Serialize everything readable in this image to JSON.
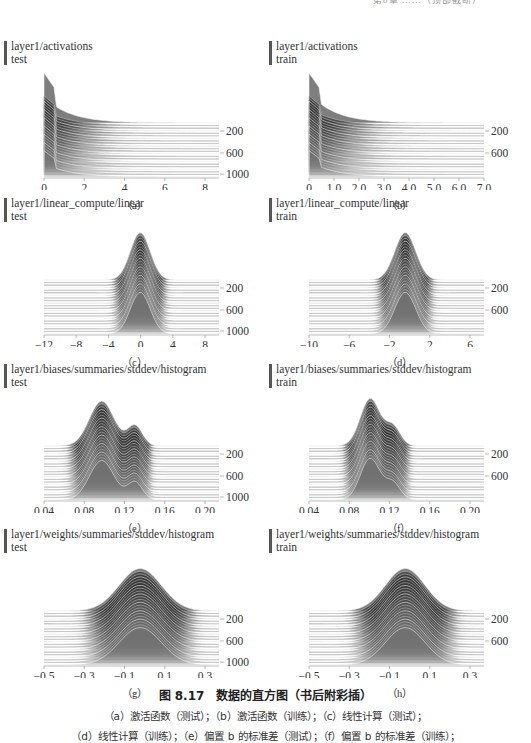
{
  "page": {
    "running_head": "第8章 ……（顶部截断）",
    "figure": {
      "number_title": "图 8.17　数据的直方图（书后附彩插）",
      "description_lines": [
        "（a）激活函数（测试）；（b）激活函数（训练）；（c）线性计算（测试）；",
        "（d）线性计算（训练）；（e）偏置 b 的标准差（测试）；（f）偏置 b 的标准差（训练）；"
      ]
    },
    "panels": [
      {
        "id": "a",
        "label": "（a）",
        "title": "layer1/activations",
        "subtitle": "test"
      },
      {
        "id": "b",
        "label": "（b）",
        "title": "layer1/activations",
        "subtitle": "train"
      },
      {
        "id": "c",
        "label": "（c）",
        "title": "layer1/linear_compute/linear",
        "subtitle": "test"
      },
      {
        "id": "d",
        "label": "（d）",
        "title": "layer1/linear_compute/linear",
        "subtitle": "train"
      },
      {
        "id": "e",
        "label": "（e）",
        "title": "layer1/biases/summaries/stddev/histogram",
        "subtitle": "test"
      },
      {
        "id": "f",
        "label": "（f）",
        "title": "layer1/biases/summaries/stddev/histogram",
        "subtitle": "train"
      },
      {
        "id": "g",
        "label": "（g）",
        "title": "layer1/weights/summaries/stddev/histogram",
        "subtitle": "test"
      },
      {
        "id": "h",
        "label": "（h）",
        "title": "layer1/weights/summaries/stddev/histogram",
        "subtitle": "train"
      }
    ]
  },
  "chart_data": [
    {
      "type": "area",
      "title": "layer1/activations",
      "subtitle": "test",
      "style": "tensorboard-histogram-offset",
      "x_ticks": [
        "0",
        "2",
        "4",
        "6",
        "8"
      ],
      "xlim": [
        0,
        9
      ],
      "y_ticks": [
        "200",
        "600",
        "1000"
      ],
      "ylabel": "step",
      "shape": "exponential decay with spike near 0"
    },
    {
      "type": "area",
      "title": "layer1/activations",
      "subtitle": "train",
      "style": "tensorboard-histogram-offset",
      "x_ticks": [
        "0",
        "1.0",
        "2.0",
        "3.0",
        "4.0",
        "5.0",
        "6.0",
        "7.0"
      ],
      "xlim": [
        0,
        7
      ],
      "y_ticks": [
        "200",
        "600"
      ],
      "ylabel": "step",
      "shape": "exponential decay with spike near 0"
    },
    {
      "type": "area",
      "title": "layer1/linear_compute/linear",
      "subtitle": "test",
      "style": "tensorboard-histogram-offset",
      "x_ticks": [
        "-12",
        "-8",
        "-4",
        "0",
        "4",
        "8"
      ],
      "xlim": [
        -12,
        10
      ],
      "y_ticks": [
        "200",
        "600",
        "1000"
      ],
      "ylabel": "step",
      "shape": "peaked bell centered at 0"
    },
    {
      "type": "area",
      "title": "layer1/linear_compute/linear",
      "subtitle": "train",
      "style": "tensorboard-histogram-offset",
      "x_ticks": [
        "-10",
        "-6",
        "-2",
        "2",
        "6"
      ],
      "xlim": [
        -10,
        8
      ],
      "y_ticks": [
        "200",
        "600"
      ],
      "ylabel": "step",
      "shape": "peaked bell centered at 0"
    },
    {
      "type": "area",
      "title": "layer1/biases/summaries/stddev/histogram",
      "subtitle": "test",
      "style": "tensorboard-histogram-offset",
      "x_ticks": [
        "0.04",
        "0.08",
        "0.12",
        "0.16",
        "0.20"
      ],
      "xlim": [
        0.04,
        0.2
      ],
      "y_ticks": [
        "200",
        "600",
        "1000"
      ],
      "ylabel": "step",
      "shape": "irregular peak near 0.10"
    },
    {
      "type": "area",
      "title": "layer1/biases/summaries/stddev/histogram",
      "subtitle": "train",
      "style": "tensorboard-histogram-offset",
      "x_ticks": [
        "0.04",
        "0.08",
        "0.12",
        "0.16",
        "0.20"
      ],
      "xlim": [
        0.04,
        0.2
      ],
      "y_ticks": [
        "200",
        "600"
      ],
      "ylabel": "step",
      "shape": "irregular peak near 0.10"
    },
    {
      "type": "area",
      "title": "layer1/weights/summaries/stddev/histogram",
      "subtitle": "test",
      "style": "tensorboard-histogram-offset",
      "x_ticks": [
        "-0.5",
        "-0.3",
        "-0.1",
        "0.1",
        "0.3"
      ],
      "xlim": [
        -0.5,
        0.4
      ],
      "y_ticks": [
        "200",
        "600",
        "1000"
      ],
      "ylabel": "step",
      "shape": "smooth bell centered at 0"
    },
    {
      "type": "area",
      "title": "layer1/weights/summaries/stddev/histogram",
      "subtitle": "train",
      "style": "tensorboard-histogram-offset",
      "x_ticks": [
        "-0.5",
        "-0.3",
        "-0.1",
        "0.1",
        "0.3"
      ],
      "xlim": [
        -0.5,
        0.4
      ],
      "y_ticks": [
        "200",
        "600"
      ],
      "ylabel": "step",
      "shape": "smooth bell centered at 0"
    }
  ]
}
